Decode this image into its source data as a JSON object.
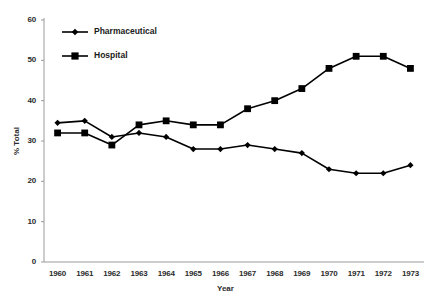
{
  "chart_data": {
    "type": "line",
    "title": "",
    "xlabel": "Year",
    "ylabel": "% Total",
    "categories": [
      "1960",
      "1961",
      "1962",
      "1963",
      "1964",
      "1965",
      "1966",
      "1967",
      "1968",
      "1969",
      "1970",
      "1971",
      "1972",
      "1973"
    ],
    "x": [
      1960,
      1961,
      1962,
      1963,
      1964,
      1965,
      1966,
      1967,
      1968,
      1969,
      1970,
      1971,
      1972,
      1973
    ],
    "ylim": [
      0,
      60
    ],
    "yticks": [
      0,
      10,
      20,
      30,
      40,
      50,
      60
    ],
    "grid": false,
    "legend_position": "top-left-inside",
    "series": [
      {
        "name": "Pharmaceutical",
        "marker": "diamond",
        "color": "#000000",
        "values": [
          34.5,
          35,
          31,
          32,
          31,
          28,
          28,
          29,
          28,
          27,
          23,
          22,
          22,
          24
        ]
      },
      {
        "name": "Hospital",
        "marker": "square",
        "color": "#000000",
        "values": [
          32,
          32,
          29,
          34,
          35,
          34,
          34,
          38,
          40,
          43,
          48,
          51,
          51,
          48
        ]
      }
    ]
  },
  "legend": {
    "items": [
      {
        "label": "Pharmaceutical"
      },
      {
        "label": "Hospital"
      }
    ]
  },
  "axes": {
    "y_title": "% Total",
    "x_title": "Year"
  }
}
